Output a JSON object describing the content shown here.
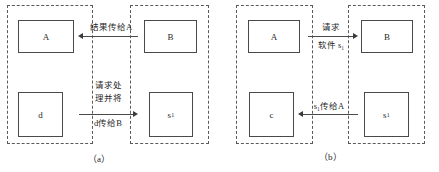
{
  "figure": {
    "panels": [
      {
        "id": "a",
        "caption": "（a）",
        "left_region": {
          "nodes": [
            {
              "id": "a-node-A",
              "label": "A"
            },
            {
              "id": "a-node-d",
              "label": "d"
            }
          ]
        },
        "right_region": {
          "nodes": [
            {
              "id": "a-node-B",
              "label": "B"
            },
            {
              "id": "a-node-s1",
              "label": "s",
              "subscript": "1"
            }
          ]
        },
        "arrows": [
          {
            "id": "a-arrow-top",
            "direction": "left",
            "labels_above": [
              "结果传给A"
            ],
            "labels_below": []
          },
          {
            "id": "a-arrow-bottom",
            "direction": "right",
            "labels_above": [
              "请求处",
              "理并将"
            ],
            "labels_below": [
              "d传给B"
            ]
          }
        ]
      },
      {
        "id": "b",
        "caption": "（b）",
        "left_region": {
          "nodes": [
            {
              "id": "b-node-A",
              "label": "A"
            },
            {
              "id": "b-node-c",
              "label": "c"
            }
          ]
        },
        "right_region": {
          "nodes": [
            {
              "id": "b-node-B",
              "label": "B"
            },
            {
              "id": "b-node-s1",
              "label": "s",
              "subscript": "1"
            }
          ]
        },
        "arrows": [
          {
            "id": "b-arrow-top",
            "direction": "right",
            "labels_above": [
              "请求"
            ],
            "labels_below": [
              "软件 s₁"
            ]
          },
          {
            "id": "b-arrow-bottom",
            "direction": "left",
            "labels_above": [
              "s₁传给A"
            ],
            "labels_below": []
          }
        ]
      }
    ],
    "colors": {
      "node_border": "#4a4a4a",
      "region_border": "#5a5a5a",
      "arrow": "#3a3a3a",
      "background": "#ffffff"
    }
  }
}
